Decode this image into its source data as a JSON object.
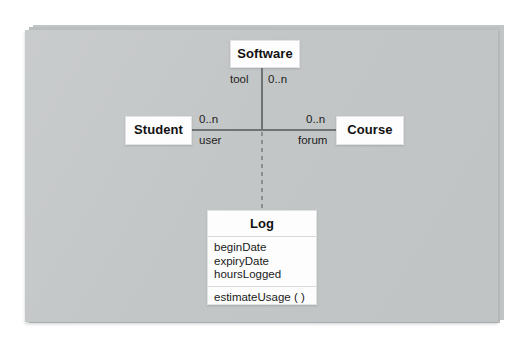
{
  "diagram": {
    "type": "uml-class-diagram",
    "classes": [
      {
        "id": "software",
        "name": "Software",
        "attributes": [],
        "operations": []
      },
      {
        "id": "student",
        "name": "Student",
        "attributes": [],
        "operations": []
      },
      {
        "id": "course",
        "name": "Course",
        "attributes": [],
        "operations": []
      },
      {
        "id": "log",
        "name": "Log",
        "attributes": [
          "beginDate",
          "expiryDate",
          "hoursLogged"
        ],
        "operations": [
          "estimateUsage ( )"
        ]
      }
    ],
    "edge_labels": {
      "software_role": "tool",
      "software_multiplicity": "0..n",
      "student_multiplicity": "0..n",
      "student_role": "user",
      "course_multiplicity": "0..n",
      "course_role": "forum"
    }
  }
}
